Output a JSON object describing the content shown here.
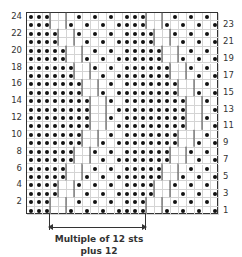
{
  "chart": {
    "columns": 24,
    "rows": 24,
    "repeat_width": 12,
    "dense_widths_by_row": [
      3,
      3,
      4,
      4,
      5,
      5,
      6,
      6,
      7,
      7,
      8,
      8,
      8,
      8,
      7,
      7,
      6,
      6,
      5,
      5,
      4,
      4,
      3,
      3
    ],
    "left_row_labels": [
      "2",
      "4",
      "6",
      "8",
      "10",
      "12",
      "14",
      "16",
      "18",
      "20",
      "22",
      "24"
    ],
    "right_row_labels": [
      "1",
      "3",
      "5",
      "7",
      "9",
      "11",
      "13",
      "15",
      "17",
      "19",
      "21",
      "23"
    ]
  },
  "caption": {
    "line1": "Multiple of 12 sts",
    "line2": "plus 12"
  },
  "colors": {
    "dot": "#111111",
    "grid": "#d4d4d4",
    "border": "#333333"
  }
}
